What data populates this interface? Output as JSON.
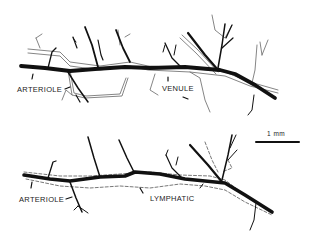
{
  "diagram": {
    "panels": [
      {
        "id": "top",
        "labels": {
          "vessel_a": "ARTERIOLE",
          "vessel_b": "VENULE"
        }
      },
      {
        "id": "bottom",
        "labels": {
          "vessel_a": "ARTERIOLE",
          "vessel_b": "LYMPHATIC"
        }
      }
    ],
    "scale_bar": {
      "label": "1 mm"
    },
    "colors": {
      "ink": "#111111",
      "paper": "#ffffff"
    }
  }
}
